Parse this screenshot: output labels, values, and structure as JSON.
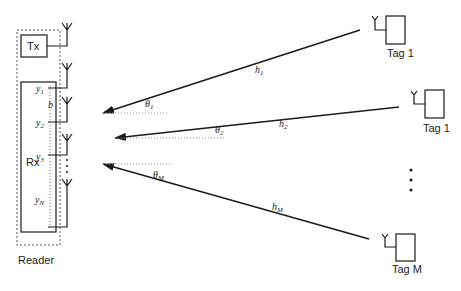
{
  "reader": {
    "label": "Reader",
    "tx_label": "Tx",
    "rx_label": "Rx",
    "spacing_label": "b",
    "outputs": [
      {
        "base": "y",
        "sub": "1"
      },
      {
        "base": "y",
        "sub": "2"
      },
      {
        "base": "y",
        "sub": "3"
      },
      {
        "base": "y",
        "sub": "N"
      }
    ]
  },
  "tags": [
    {
      "label": "Tag 1",
      "channel": {
        "base": "h",
        "sub": "1"
      },
      "angle": {
        "base": "θ",
        "sub": "1"
      }
    },
    {
      "label": "Tag 1",
      "channel": {
        "base": "h",
        "sub": "2"
      },
      "angle": {
        "base": "θ",
        "sub": "2"
      }
    },
    {
      "label": "Tag M",
      "channel": {
        "base": "h",
        "sub": "M"
      },
      "angle": {
        "base": "θ",
        "sub": "M"
      }
    }
  ],
  "ellipsis": "⋮",
  "colors": {
    "line": "#1a1a1a",
    "dashed": "#555555",
    "dotted": "#999999"
  }
}
